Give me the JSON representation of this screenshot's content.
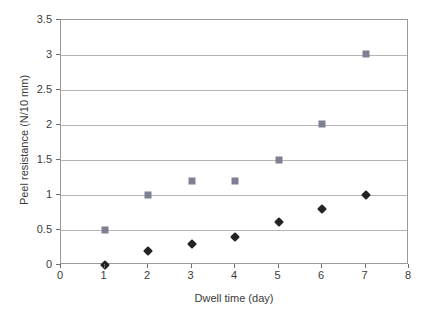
{
  "chart_data": {
    "type": "scatter",
    "title": "",
    "xlabel": "Dwell time (day)",
    "ylabel": "Peel resistance (N/10 mm)",
    "xlim": [
      0,
      8
    ],
    "ylim": [
      0,
      3.5
    ],
    "grid": "horizontal",
    "legend": "none",
    "xticks": [
      "0",
      "1",
      "2",
      "3",
      "4",
      "5",
      "6",
      "7",
      "8"
    ],
    "xtick_values": [
      0,
      1,
      2,
      3,
      4,
      5,
      6,
      7,
      8
    ],
    "yticks": [
      "0",
      "0.5",
      "1",
      "1.5",
      "2",
      "2.5",
      "3",
      "3.5"
    ],
    "ytick_values": [
      0,
      0.5,
      1,
      1.5,
      2,
      2.5,
      3,
      3.5
    ],
    "x": [
      1,
      2,
      3,
      4,
      5,
      6,
      7
    ],
    "series": [
      {
        "name": "diamond-series",
        "marker": "diamond",
        "color": "#232323",
        "values": [
          0,
          0.2,
          0.3,
          0.4,
          0.62,
          0.8,
          1.0
        ]
      },
      {
        "name": "square-series",
        "marker": "square",
        "color": "#7f7f93",
        "values": [
          0.5,
          1.0,
          1.2,
          1.2,
          1.5,
          2.02,
          3.02
        ]
      }
    ],
    "colors": {
      "background": "#ffffff",
      "gridline": "#b5b5b5",
      "axis_border": "#9a9a9a",
      "text": "#3b3b3b"
    }
  }
}
